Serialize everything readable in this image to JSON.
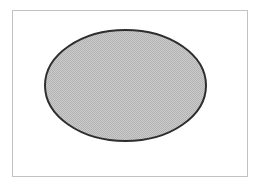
{
  "diagram": {
    "frame": {
      "border_color": "#c2c2c2",
      "background": "#ffffff"
    },
    "shape": {
      "type": "ellipse",
      "cx": 125.5,
      "cy": 85.5,
      "rx": 80.5,
      "ry": 55.5,
      "stroke_color": "#2e2e2e",
      "stroke_width": 2,
      "fill_pattern": "checkerboard-dither",
      "fill_color_light": "#cbcbcb",
      "fill_color_dark": "#b3b3b3"
    }
  }
}
